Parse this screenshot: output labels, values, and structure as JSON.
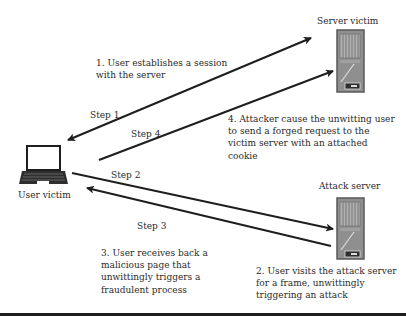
{
  "diagram": {
    "nodes": {
      "user_victim": {
        "label": "User victim",
        "icon": "laptop-icon"
      },
      "server_victim": {
        "label": "Server victim",
        "icon": "server-icon"
      },
      "attack_server": {
        "label": "Attack server",
        "icon": "server-icon"
      }
    },
    "steps": [
      {
        "label": "Step 1",
        "from": "user_victim",
        "to": "server_victim",
        "bidirectional": true,
        "description": "1. User establishes a session\nwith the server"
      },
      {
        "label": "Step 2",
        "from": "user_victim",
        "to": "attack_server",
        "bidirectional": false,
        "description": "2. User visits the attack server\nfor a frame, unwittingly\ntriggering an attack"
      },
      {
        "label": "Step 3",
        "from": "attack_server",
        "to": "user_victim",
        "bidirectional": false,
        "description": "3. User receives back a\nmalicious page that\nunwittingly triggers a\nfraudulent process"
      },
      {
        "label": "Step 4",
        "from": "user_victim",
        "to": "server_victim",
        "bidirectional": false,
        "description": "4. Attacker cause the unwitting user\nto send a forged request to the\nvictim server with an attached\ncookie"
      }
    ],
    "colors": {
      "line": "#1e1e1e",
      "server_body": "#8f8f8f",
      "server_frame": "#5a5a5a",
      "text": "#2a2a2a"
    }
  }
}
